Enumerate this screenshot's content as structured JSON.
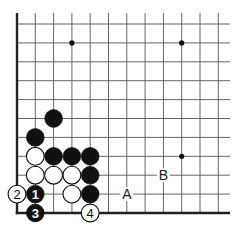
{
  "diagram": {
    "type": "go-board-corner",
    "grid": {
      "origin_x": 17,
      "origin_y": 213,
      "col_spacing": 18.3,
      "row_spacing": 18.9,
      "cols": 12,
      "rows": 11,
      "top_y": 13,
      "right_x": 230,
      "line_color": "#555555",
      "edge_color": "#222222"
    },
    "star_points": [
      {
        "col": 3,
        "row": 9
      },
      {
        "col": 9,
        "row": 9
      },
      {
        "col": 9,
        "row": 3
      }
    ],
    "stones": [
      {
        "color": "black",
        "col": 2,
        "row": 5,
        "label": ""
      },
      {
        "color": "black",
        "col": 1,
        "row": 4,
        "label": ""
      },
      {
        "color": "white",
        "col": 1,
        "row": 3,
        "label": ""
      },
      {
        "color": "black",
        "col": 2,
        "row": 3,
        "label": ""
      },
      {
        "color": "black",
        "col": 3,
        "row": 3,
        "label": ""
      },
      {
        "color": "black",
        "col": 4,
        "row": 3,
        "label": ""
      },
      {
        "color": "white",
        "col": 1,
        "row": 2,
        "label": ""
      },
      {
        "color": "white",
        "col": 2,
        "row": 2,
        "label": ""
      },
      {
        "color": "white",
        "col": 3,
        "row": 2,
        "label": ""
      },
      {
        "color": "black",
        "col": 4,
        "row": 2,
        "label": ""
      },
      {
        "color": "white",
        "col": 0,
        "row": 1,
        "label": "2"
      },
      {
        "color": "black",
        "col": 1,
        "row": 1,
        "label": "1"
      },
      {
        "color": "white",
        "col": 3,
        "row": 1,
        "label": ""
      },
      {
        "color": "black",
        "col": 4,
        "row": 1,
        "label": ""
      },
      {
        "color": "black",
        "col": 1,
        "row": 0,
        "label": "3"
      },
      {
        "color": "white",
        "col": 4,
        "row": 0,
        "label": "4"
      }
    ],
    "point_labels": [
      {
        "text": "A",
        "col": 6,
        "row": 1
      },
      {
        "text": "B",
        "col": 8,
        "row": 2
      }
    ]
  }
}
